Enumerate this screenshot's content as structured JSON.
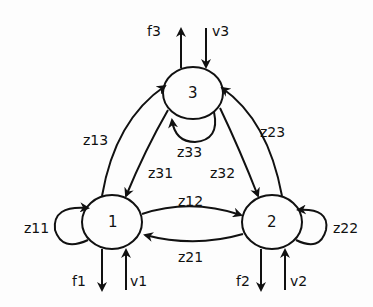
{
  "diagram": {
    "type": "directed-graph",
    "nodes": [
      {
        "id": "1",
        "label": "1"
      },
      {
        "id": "2",
        "label": "2"
      },
      {
        "id": "3",
        "label": "3"
      }
    ],
    "edges": [
      {
        "from": "1",
        "to": "1",
        "label": "z11"
      },
      {
        "from": "1",
        "to": "2",
        "label": "z12"
      },
      {
        "from": "1",
        "to": "3",
        "label": "z13"
      },
      {
        "from": "2",
        "to": "1",
        "label": "z21"
      },
      {
        "from": "2",
        "to": "2",
        "label": "z22"
      },
      {
        "from": "2",
        "to": "3",
        "label": "z23"
      },
      {
        "from": "3",
        "to": "1",
        "label": "z31"
      },
      {
        "from": "3",
        "to": "2",
        "label": "z32"
      },
      {
        "from": "3",
        "to": "3",
        "label": "z33"
      }
    ],
    "external": [
      {
        "node": "1",
        "out": "f1",
        "in": "v1"
      },
      {
        "node": "2",
        "out": "f2",
        "in": "v2"
      },
      {
        "node": "3",
        "out": "f3",
        "in": "v3"
      }
    ]
  },
  "labels": {
    "n1": "1",
    "n2": "2",
    "n3": "3",
    "z11": "z11",
    "z12": "z12",
    "z13": "z13",
    "z21": "z21",
    "z22": "z22",
    "z23": "z23",
    "z31": "z31",
    "z32": "z32",
    "z33": "z33",
    "f1": "f1",
    "f2": "f2",
    "f3": "f3",
    "v1": "v1",
    "v2": "v2",
    "v3": "v3"
  },
  "colors": {
    "stroke": "#111111",
    "background": "#fdfdfd"
  }
}
